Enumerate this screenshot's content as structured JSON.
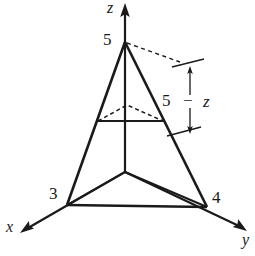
{
  "figure": {
    "kind": "3d-coordinate-diagram",
    "stroke_color": "#1a1a1a",
    "background_color": "#ffffff",
    "axes": [
      {
        "name": "x-axis",
        "label": "x",
        "label_x": 6,
        "label_y": 221,
        "tip_x": 22,
        "tip_y": 232
      },
      {
        "name": "y-axis",
        "label": "y",
        "label_x": 243,
        "label_y": 234,
        "tip_x": 245,
        "tip_y": 230
      },
      {
        "name": "z-axis",
        "label": "z",
        "label_x": 107,
        "label_y": 0,
        "tip_x": 125,
        "tip_y": 5
      }
    ],
    "vertices": [
      {
        "name": "z-intercept",
        "label": "5",
        "x": 125,
        "y": 42,
        "label_x": 104,
        "label_y": 33
      },
      {
        "name": "x-intercept",
        "label": "3",
        "x": 67,
        "y": 205,
        "label_x": 50,
        "label_y": 186
      },
      {
        "name": "y-intercept",
        "label": "4",
        "x": 207,
        "y": 207,
        "label_x": 213,
        "label_y": 190
      },
      {
        "name": "origin",
        "label": "",
        "x": 125,
        "y": 172,
        "label_x": 0,
        "label_y": 0
      }
    ],
    "annotation": {
      "name": "height-annotation",
      "text_5": "5",
      "text_minus": "−",
      "text_z": "z",
      "full_text": "5 − z",
      "text_x": 163,
      "text_y": 94,
      "arrow_x": 190,
      "arrow_top_y": 66,
      "arrow_bottom_y": 133
    },
    "cross_section": {
      "name": "cross-section-triangle",
      "left_x": 98,
      "left_y": 121,
      "right_x": 163,
      "right_y": 121,
      "back_x": 127,
      "back_y": 105
    }
  }
}
